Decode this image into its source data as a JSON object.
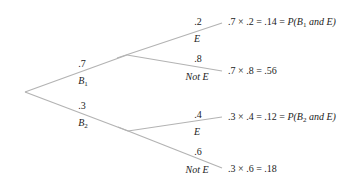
{
  "diagram": {
    "type": "probability-tree",
    "line_color": "#b3b3b3",
    "first_level": [
      {
        "prob": ".7",
        "event": "B",
        "event_sub": "1"
      },
      {
        "prob": ".3",
        "event": "B",
        "event_sub": "2"
      }
    ],
    "second_level": [
      {
        "prob": ".2",
        "event": "E",
        "result_calc": ".7 × .2 = .14 = ",
        "result_p": "P(B",
        "result_sub": "1",
        "result_tail": " and E)"
      },
      {
        "prob": ".8",
        "event": "Not E",
        "result_calc": ".7 × .8 = .56"
      },
      {
        "prob": ".4",
        "event": "E",
        "result_calc": ".3 × .4 = .12 = ",
        "result_p": "P(B",
        "result_sub": "2",
        "result_tail": " and E)"
      },
      {
        "prob": ".6",
        "event": "Not E",
        "result_calc": ".3 × .6 = .18"
      }
    ]
  }
}
